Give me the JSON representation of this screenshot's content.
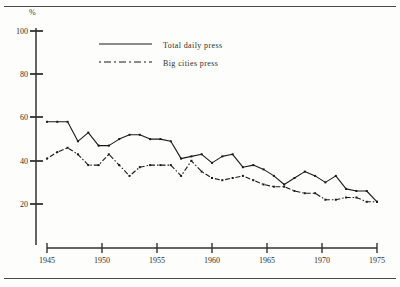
{
  "figure": {
    "unit_label": "%",
    "frame_rules": 2
  },
  "legend": {
    "position": "top-center",
    "entries": [
      {
        "label": "Total daily press",
        "style": "solid",
        "color": "#1a1a1a"
      },
      {
        "label": "Big cities press",
        "style": "dash-dot",
        "color": "#1a1a1a"
      }
    ]
  },
  "axes": {
    "y_ticks": [
      "100",
      "80",
      "60",
      "40",
      "20"
    ],
    "x_ticks": [
      "1945",
      "1950",
      "1955",
      "1960",
      "1965",
      "1970",
      "1975"
    ]
  },
  "chart_data": {
    "type": "line",
    "title": "",
    "subtitle": "",
    "xlabel": "",
    "ylabel": "%",
    "xlim": [
      1944,
      1976
    ],
    "ylim": [
      0,
      100
    ],
    "grid": false,
    "legend_position": "top-center",
    "x": [
      1944,
      1945,
      1946,
      1947,
      1948,
      1949,
      1950,
      1951,
      1952,
      1953,
      1954,
      1955,
      1956,
      1957,
      1958,
      1959,
      1960,
      1961,
      1962,
      1963,
      1964,
      1965,
      1966,
      1967,
      1968,
      1969,
      1970,
      1971,
      1972,
      1973,
      1974,
      1975,
      1976
    ],
    "series": [
      {
        "name": "Total daily press",
        "style": "solid",
        "color": "#1a1a1a",
        "values": [
          58,
          58,
          58,
          49,
          53,
          47,
          47,
          50,
          52,
          52,
          50,
          50,
          49,
          41,
          42,
          43,
          39,
          42,
          43,
          37,
          38,
          36,
          33,
          29,
          32,
          35,
          33,
          30,
          33,
          27,
          26,
          26,
          21
        ]
      },
      {
        "name": "Big cities press",
        "style": "dash-dot",
        "color": "#1a1a1a",
        "values": [
          41,
          44,
          46,
          43,
          38,
          38,
          43,
          38,
          33,
          37,
          38,
          38,
          38,
          33,
          40,
          35,
          32,
          31,
          32,
          33,
          31,
          29,
          28,
          28,
          26,
          25,
          25,
          22,
          22,
          23,
          23,
          21,
          21
        ]
      }
    ],
    "annotations": []
  }
}
